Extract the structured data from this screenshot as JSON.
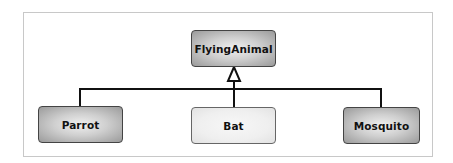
{
  "diagram": {
    "type": "uml-class-inheritance",
    "parent": {
      "label": "FlyingAnimal",
      "style": "dark"
    },
    "children": [
      {
        "label": "Parrot",
        "style": "dark"
      },
      {
        "label": "Bat",
        "style": "light"
      },
      {
        "label": "Mosquito",
        "style": "dark"
      }
    ],
    "relationship": "generalization",
    "colors": {
      "frame_border": "#c8c8c8",
      "node_border": "#444444",
      "line": "#111111",
      "dark_fill_edge": "#9a9a9a",
      "dark_fill_center": "#f0f0f0",
      "light_fill": "#efefef"
    }
  }
}
